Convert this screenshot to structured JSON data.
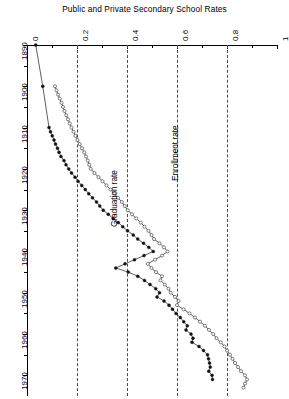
{
  "chart_data": {
    "type": "line",
    "title": "Public and Private Secondary School Rates",
    "orientation": "rotated-90",
    "xlabel": "",
    "ylabel": "",
    "xlim": [
      0,
      1
    ],
    "ylim": [
      1890,
      1975
    ],
    "grid": true,
    "grid_axis": "rate",
    "legend_position": "inline-annotation",
    "rate_ticks": [
      "0",
      "0.2",
      "0.4",
      "0.6",
      "0.8",
      "1"
    ],
    "rate_tick_values": [
      0,
      0.2,
      0.4,
      0.6,
      0.8,
      1
    ],
    "rate_minor_tick_values": [
      0.1,
      0.3,
      0.5,
      0.7,
      0.9
    ],
    "year_ticks": [
      "1890",
      "1900",
      "1910",
      "1920",
      "1930",
      "1940",
      "1950",
      "1960",
      "1970"
    ],
    "year_tick_values": [
      1890,
      1900,
      1910,
      1920,
      1930,
      1940,
      1950,
      1960,
      1970
    ],
    "year_minor_tick_values": [
      1895,
      1905,
      1915,
      1925,
      1935,
      1945,
      1955,
      1965
    ],
    "series": [
      {
        "name": "Graduation rate",
        "marker": "filled-circle",
        "color": "#111111",
        "label_position": {
          "year": 1934,
          "rate": 0.33
        },
        "points": [
          {
            "year": 1890,
            "rate": 0.035
          },
          {
            "year": 1900,
            "rate": 0.063
          },
          {
            "year": 1910,
            "rate": 0.088
          },
          {
            "year": 1911,
            "rate": 0.094
          },
          {
            "year": 1912,
            "rate": 0.101
          },
          {
            "year": 1913,
            "rate": 0.108
          },
          {
            "year": 1914,
            "rate": 0.114
          },
          {
            "year": 1915,
            "rate": 0.122
          },
          {
            "year": 1916,
            "rate": 0.128
          },
          {
            "year": 1917,
            "rate": 0.136
          },
          {
            "year": 1918,
            "rate": 0.148
          },
          {
            "year": 1919,
            "rate": 0.156
          },
          {
            "year": 1920,
            "rate": 0.167
          },
          {
            "year": 1921,
            "rate": 0.178
          },
          {
            "year": 1922,
            "rate": 0.192
          },
          {
            "year": 1923,
            "rate": 0.204
          },
          {
            "year": 1924,
            "rate": 0.219
          },
          {
            "year": 1925,
            "rate": 0.233
          },
          {
            "year": 1926,
            "rate": 0.247
          },
          {
            "year": 1927,
            "rate": 0.262
          },
          {
            "year": 1928,
            "rate": 0.278
          },
          {
            "year": 1929,
            "rate": 0.291
          },
          {
            "year": 1930,
            "rate": 0.305
          },
          {
            "year": 1931,
            "rate": 0.325
          },
          {
            "year": 1932,
            "rate": 0.345
          },
          {
            "year": 1933,
            "rate": 0.365
          },
          {
            "year": 1934,
            "rate": 0.383
          },
          {
            "year": 1935,
            "rate": 0.402
          },
          {
            "year": 1936,
            "rate": 0.425
          },
          {
            "year": 1937,
            "rate": 0.443
          },
          {
            "year": 1938,
            "rate": 0.466
          },
          {
            "year": 1939,
            "rate": 0.487
          },
          {
            "year": 1940,
            "rate": 0.505
          },
          {
            "year": 1941,
            "rate": 0.468
          },
          {
            "year": 1942,
            "rate": 0.43
          },
          {
            "year": 1943,
            "rate": 0.392
          },
          {
            "year": 1944,
            "rate": 0.355
          },
          {
            "year": 1945,
            "rate": 0.405
          },
          {
            "year": 1946,
            "rate": 0.443
          },
          {
            "year": 1947,
            "rate": 0.47
          },
          {
            "year": 1948,
            "rate": 0.492
          },
          {
            "year": 1949,
            "rate": 0.515
          },
          {
            "year": 1950,
            "rate": 0.53
          },
          {
            "year": 1951,
            "rate": 0.52
          },
          {
            "year": 1952,
            "rate": 0.548
          },
          {
            "year": 1953,
            "rate": 0.568
          },
          {
            "year": 1954,
            "rate": 0.582
          },
          {
            "year": 1955,
            "rate": 0.596
          },
          {
            "year": 1956,
            "rate": 0.613
          },
          {
            "year": 1957,
            "rate": 0.627
          },
          {
            "year": 1958,
            "rate": 0.641
          },
          {
            "year": 1959,
            "rate": 0.636
          },
          {
            "year": 1960,
            "rate": 0.656
          },
          {
            "year": 1961,
            "rate": 0.664
          },
          {
            "year": 1962,
            "rate": 0.66
          },
          {
            "year": 1963,
            "rate": 0.688
          },
          {
            "year": 1964,
            "rate": 0.706
          },
          {
            "year": 1965,
            "rate": 0.722
          },
          {
            "year": 1966,
            "rate": 0.726
          },
          {
            "year": 1967,
            "rate": 0.73
          },
          {
            "year": 1968,
            "rate": 0.733
          },
          {
            "year": 1969,
            "rate": 0.727
          },
          {
            "year": 1970,
            "rate": 0.74
          },
          {
            "year": 1971,
            "rate": 0.742
          }
        ]
      },
      {
        "name": "Enrollment rate",
        "marker": "open-circle",
        "color": "#333333",
        "label_position": {
          "year": 1923,
          "rate": 0.575
        },
        "points": [
          {
            "year": 1900,
            "rate": 0.112
          },
          {
            "year": 1901,
            "rate": 0.118
          },
          {
            "year": 1902,
            "rate": 0.124
          },
          {
            "year": 1903,
            "rate": 0.131
          },
          {
            "year": 1904,
            "rate": 0.138
          },
          {
            "year": 1905,
            "rate": 0.144
          },
          {
            "year": 1906,
            "rate": 0.15
          },
          {
            "year": 1907,
            "rate": 0.157
          },
          {
            "year": 1908,
            "rate": 0.164
          },
          {
            "year": 1909,
            "rate": 0.171
          },
          {
            "year": 1910,
            "rate": 0.178
          },
          {
            "year": 1911,
            "rate": 0.186
          },
          {
            "year": 1912,
            "rate": 0.194
          },
          {
            "year": 1913,
            "rate": 0.202
          },
          {
            "year": 1914,
            "rate": 0.211
          },
          {
            "year": 1915,
            "rate": 0.22
          },
          {
            "year": 1916,
            "rate": 0.229
          },
          {
            "year": 1917,
            "rate": 0.236
          },
          {
            "year": 1918,
            "rate": 0.243
          },
          {
            "year": 1919,
            "rate": 0.249
          },
          {
            "year": 1920,
            "rate": 0.255
          },
          {
            "year": 1921,
            "rate": 0.27
          },
          {
            "year": 1922,
            "rate": 0.286
          },
          {
            "year": 1923,
            "rate": 0.302
          },
          {
            "year": 1924,
            "rate": 0.318
          },
          {
            "year": 1925,
            "rate": 0.334
          },
          {
            "year": 1926,
            "rate": 0.349
          },
          {
            "year": 1927,
            "rate": 0.364
          },
          {
            "year": 1928,
            "rate": 0.379
          },
          {
            "year": 1929,
            "rate": 0.391
          },
          {
            "year": 1930,
            "rate": 0.403
          },
          {
            "year": 1931,
            "rate": 0.42
          },
          {
            "year": 1932,
            "rate": 0.437
          },
          {
            "year": 1933,
            "rate": 0.455
          },
          {
            "year": 1934,
            "rate": 0.47
          },
          {
            "year": 1935,
            "rate": 0.486
          },
          {
            "year": 1936,
            "rate": 0.498
          },
          {
            "year": 1937,
            "rate": 0.508
          },
          {
            "year": 1938,
            "rate": 0.53
          },
          {
            "year": 1939,
            "rate": 0.548
          },
          {
            "year": 1940,
            "rate": 0.562
          },
          {
            "year": 1941,
            "rate": 0.54
          },
          {
            "year": 1942,
            "rate": 0.512
          },
          {
            "year": 1943,
            "rate": 0.483
          },
          {
            "year": 1944,
            "rate": 0.498
          },
          {
            "year": 1945,
            "rate": 0.516
          },
          {
            "year": 1946,
            "rate": 0.54
          },
          {
            "year": 1947,
            "rate": 0.534
          },
          {
            "year": 1948,
            "rate": 0.551
          },
          {
            "year": 1949,
            "rate": 0.566
          },
          {
            "year": 1950,
            "rate": 0.575
          },
          {
            "year": 1951,
            "rate": 0.592
          },
          {
            "year": 1952,
            "rate": 0.606
          },
          {
            "year": 1953,
            "rate": 0.6
          },
          {
            "year": 1954,
            "rate": 0.626
          },
          {
            "year": 1955,
            "rate": 0.65
          },
          {
            "year": 1956,
            "rate": 0.672
          },
          {
            "year": 1957,
            "rate": 0.692
          },
          {
            "year": 1958,
            "rate": 0.712
          },
          {
            "year": 1959,
            "rate": 0.728
          },
          {
            "year": 1960,
            "rate": 0.745
          },
          {
            "year": 1961,
            "rate": 0.758
          },
          {
            "year": 1962,
            "rate": 0.775
          },
          {
            "year": 1963,
            "rate": 0.79
          },
          {
            "year": 1964,
            "rate": 0.8
          },
          {
            "year": 1965,
            "rate": 0.812
          },
          {
            "year": 1966,
            "rate": 0.822
          },
          {
            "year": 1967,
            "rate": 0.832
          },
          {
            "year": 1968,
            "rate": 0.844
          },
          {
            "year": 1969,
            "rate": 0.856
          },
          {
            "year": 1970,
            "rate": 0.872
          },
          {
            "year": 1971,
            "rate": 0.88
          },
          {
            "year": 1972,
            "rate": 0.872
          },
          {
            "year": 1973,
            "rate": 0.866
          }
        ]
      }
    ]
  }
}
